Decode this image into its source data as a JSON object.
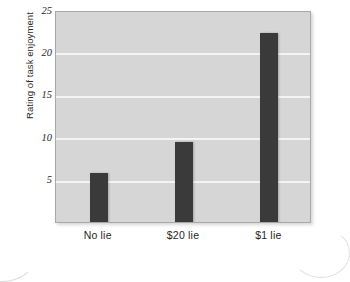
{
  "chart_data": {
    "type": "bar",
    "title": "",
    "xlabel": "",
    "ylabel": "Rating of task enjoyment",
    "categories": [
      "No lie",
      "$20 lie",
      "$1 lie"
    ],
    "values": [
      6.0,
      9.7,
      22.5
    ],
    "ylim": [
      0,
      25
    ],
    "yticks": [
      5,
      10,
      15,
      20,
      25
    ],
    "ytick_labels": [
      "5",
      "10",
      "15",
      "20",
      "25"
    ],
    "grid": "horizontal",
    "legend": "none",
    "colors": {
      "bar": "#3a3a3a",
      "plot_background": "#d6d6d6",
      "gridline": "#f4f4f4",
      "plot_border": "#a8a8a8",
      "page_background": "#ffffff",
      "text": "#1f1f1f"
    }
  }
}
